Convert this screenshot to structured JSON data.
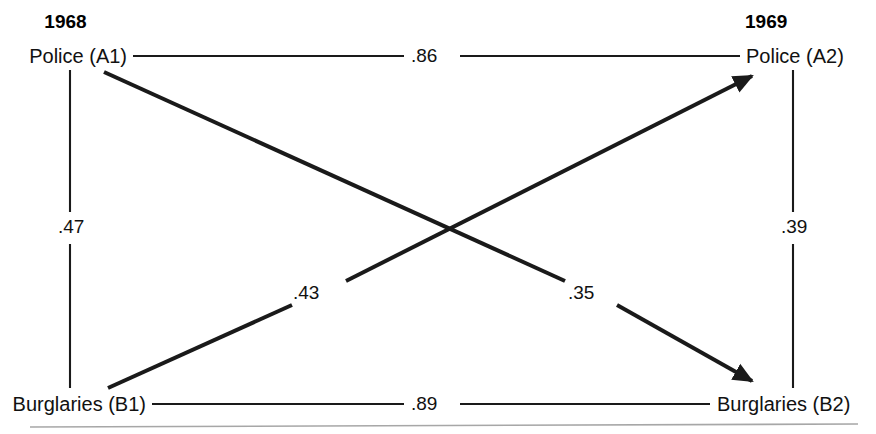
{
  "figure": {
    "type": "cross-lagged-panel-diagram",
    "columns": [
      {
        "id": "t1",
        "year": "1968"
      },
      {
        "id": "t2",
        "year": "1969"
      }
    ],
    "nodes": [
      {
        "id": "A1",
        "label": "Police (A1)",
        "column": "t1",
        "row": "top"
      },
      {
        "id": "B1",
        "label": "Burglaries (B1)",
        "column": "t1",
        "row": "bottom"
      },
      {
        "id": "A2",
        "label": "Police (A2)",
        "column": "t2",
        "row": "top"
      },
      {
        "id": "B2",
        "label": "Burglaries (B2)",
        "column": "t2",
        "row": "bottom"
      }
    ],
    "paths": [
      {
        "id": "A1-A2",
        "from": "A1",
        "to": "A2",
        "value": ".86",
        "kind": "horizontal-top",
        "arrow": false
      },
      {
        "id": "B1-B2",
        "from": "B1",
        "to": "B2",
        "value": ".89",
        "kind": "horizontal-bottom",
        "arrow": false
      },
      {
        "id": "A1-B1",
        "from": "A1",
        "to": "B1",
        "value": ".47",
        "kind": "vertical-left",
        "arrow": false
      },
      {
        "id": "A2-B2",
        "from": "A2",
        "to": "B2",
        "value": ".39",
        "kind": "vertical-right",
        "arrow": false
      },
      {
        "id": "B1-A2",
        "from": "B1",
        "to": "A2",
        "value": ".43",
        "kind": "diagonal-ascending",
        "arrow": true
      },
      {
        "id": "A1-B2",
        "from": "A1",
        "to": "B2",
        "value": ".35",
        "kind": "diagonal-descending",
        "arrow": true
      }
    ],
    "colors": {
      "line": "#1a1a1a",
      "text": "#111111",
      "background": "#ffffff",
      "footer_rule": "#8a8a8a"
    }
  }
}
